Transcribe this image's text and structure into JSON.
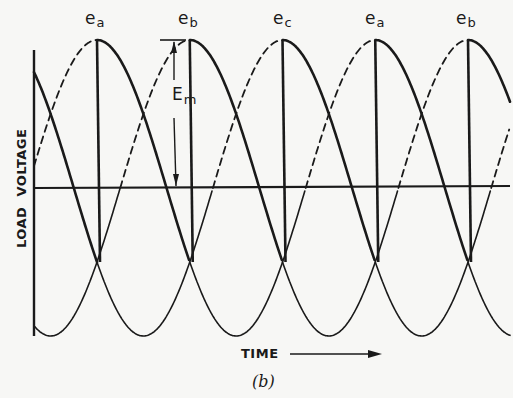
{
  "figure": {
    "caption": "(b)",
    "x_axis_label": "TIME",
    "y_axis_label": "LOAD  VOLTAGE",
    "amplitude_label": "E",
    "amplitude_subscript": "m",
    "colors": {
      "ink": "#1a1a1a",
      "paper": "#f7f7f5"
    },
    "peaks": [
      {
        "label": "e",
        "sub": "a",
        "x": 97
      },
      {
        "label": "e",
        "sub": "b",
        "x": 190
      },
      {
        "label": "e",
        "sub": "c",
        "x": 285
      },
      {
        "label": "e",
        "sub": "a",
        "x": 377
      },
      {
        "label": "e",
        "sub": "b",
        "x": 468
      }
    ]
  },
  "chart_data": {
    "type": "line",
    "xlabel": "TIME",
    "ylabel": "LOAD VOLTAGE",
    "series": [
      {
        "name": "e_a",
        "form": "Em*cos(wt)"
      },
      {
        "name": "e_b",
        "form": "Em*cos(wt-120deg)"
      },
      {
        "name": "e_c",
        "form": "Em*cos(wt-240deg)"
      }
    ],
    "peak_sequence": [
      "e_a",
      "e_b",
      "e_c",
      "e_a",
      "e_b"
    ],
    "annotations": [
      "E_m (peak amplitude arrow from axis to peak)",
      "TIME arrow"
    ],
    "grid": false
  }
}
